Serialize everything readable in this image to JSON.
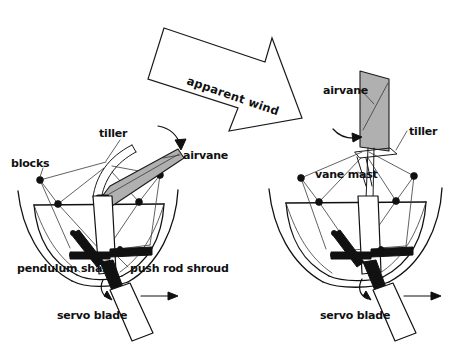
{
  "figure": {
    "title": "apparent wind",
    "background_color": "#ffffff",
    "ink_color": "#111111",
    "vane_fill_color": "#b0b0b0"
  },
  "wind_arrow": {
    "label": "apparent wind",
    "direction": "down-right",
    "style": "hollow-outlined-block-arrow"
  },
  "left_view": {
    "name": "side-view",
    "labels": {
      "tiller": "tiller",
      "airvane": "airvane",
      "blocks": "blocks",
      "pendulum_shaft": "pendulum shaft",
      "push_rod_shroud": "push rod shroud",
      "servo_blade": "servo blade"
    },
    "icons": {
      "vane_rotation": "curved-arrow-icon",
      "shaft_rotation": "curved-arrow-icon",
      "travel_direction": "straight-arrow-icon"
    }
  },
  "right_view": {
    "name": "rear-view",
    "labels": {
      "airvane": "airvane",
      "tiller": "tiller",
      "vane_mast": "vane mast",
      "servo_blade": "servo blade"
    },
    "icons": {
      "vane_rotation": "curved-arrow-icon",
      "shaft_rotation": "curved-arrow-icon",
      "travel_direction": "straight-arrow-icon"
    }
  }
}
